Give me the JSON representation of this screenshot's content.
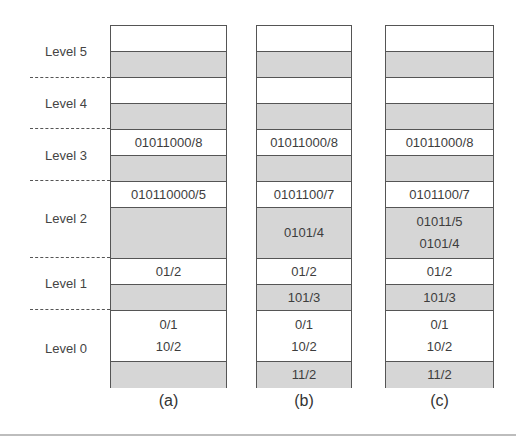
{
  "levels": [
    {
      "label": "Level 5"
    },
    {
      "label": "Level 4"
    },
    {
      "label": "Level 3"
    },
    {
      "label": "Level 2"
    },
    {
      "label": "Level 1"
    },
    {
      "label": "Level 0"
    }
  ],
  "columns": [
    {
      "caption": "(a)",
      "cells": [
        {
          "shade": "white",
          "entries": []
        },
        {
          "shade": "gray",
          "entries": []
        },
        {
          "shade": "white",
          "entries": []
        },
        {
          "shade": "gray",
          "entries": []
        },
        {
          "shade": "white",
          "entries": [
            "01011000/8"
          ]
        },
        {
          "shade": "gray",
          "entries": []
        },
        {
          "shade": "white",
          "entries": [
            "010110000/5"
          ]
        },
        {
          "shade": "gray",
          "entries": []
        },
        {
          "shade": "white",
          "entries": [
            "01/2"
          ]
        },
        {
          "shade": "gray",
          "entries": []
        },
        {
          "shade": "white",
          "entries": [
            "0/1",
            "10/2"
          ]
        },
        {
          "shade": "gray",
          "entries": []
        }
      ]
    },
    {
      "caption": "(b)",
      "cells": [
        {
          "shade": "white",
          "entries": []
        },
        {
          "shade": "gray",
          "entries": []
        },
        {
          "shade": "white",
          "entries": []
        },
        {
          "shade": "gray",
          "entries": []
        },
        {
          "shade": "white",
          "entries": [
            "01011000/8"
          ]
        },
        {
          "shade": "gray",
          "entries": []
        },
        {
          "shade": "white",
          "entries": [
            "0101100/7"
          ]
        },
        {
          "shade": "gray",
          "entries": [
            "0101/4"
          ]
        },
        {
          "shade": "white",
          "entries": [
            "01/2"
          ]
        },
        {
          "shade": "gray",
          "entries": [
            "101/3"
          ]
        },
        {
          "shade": "white",
          "entries": [
            "0/1",
            "10/2"
          ]
        },
        {
          "shade": "gray",
          "entries": [
            "11/2"
          ]
        }
      ]
    },
    {
      "caption": "(c)",
      "cells": [
        {
          "shade": "white",
          "entries": []
        },
        {
          "shade": "gray",
          "entries": []
        },
        {
          "shade": "white",
          "entries": []
        },
        {
          "shade": "gray",
          "entries": []
        },
        {
          "shade": "white",
          "entries": [
            "01011000/8"
          ]
        },
        {
          "shade": "gray",
          "entries": []
        },
        {
          "shade": "white",
          "entries": [
            "0101100/7"
          ]
        },
        {
          "shade": "gray",
          "entries": [
            "01011/5",
            "0101/4"
          ]
        },
        {
          "shade": "white",
          "entries": [
            "01/2"
          ]
        },
        {
          "shade": "gray",
          "entries": [
            "101/3"
          ]
        },
        {
          "shade": "white",
          "entries": [
            "0/1",
            "10/2"
          ]
        },
        {
          "shade": "gray",
          "entries": [
            "11/2"
          ]
        }
      ]
    }
  ],
  "colors": {
    "gray_cell": "#d6d6d6",
    "white_cell": "#ffffff",
    "border": "#555555"
  }
}
